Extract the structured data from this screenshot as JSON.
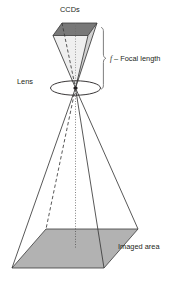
{
  "figure": {
    "labels": {
      "ccds": "CCDs",
      "lens": "Lens",
      "focal_symbol": "f",
      "focal_text": "– Focal length",
      "imaged_area": "Imaged area"
    },
    "colors": {
      "background": "#ffffff",
      "ink": "#231f20",
      "line": "#3a3a3a",
      "ccd_top_fill": "#787878",
      "ccd_side_fill": "#c9c9c9",
      "imaged_area_fill": "#b2b2b2",
      "bracket": "#6f6f6f"
    },
    "geometry": {
      "apex": {
        "x": 75.5,
        "y": 88.0
      },
      "ccd_plane": {
        "front_left": {
          "x": 53.0,
          "y": 35.5
        },
        "front_right": {
          "x": 88.0,
          "y": 35.5
        },
        "back_right": {
          "x": 97.0,
          "y": 23.0
        },
        "back_left": {
          "x": 62.0,
          "y": 23.0
        }
      },
      "imaged_plane": {
        "front_left": {
          "x": 12.0,
          "y": 268.0
        },
        "front_right": {
          "x": 104.0,
          "y": 268.0
        },
        "back_right": {
          "x": 138.0,
          "y": 229.0
        },
        "back_left": {
          "x": 46.0,
          "y": 229.0
        }
      },
      "lens_ellipse": {
        "cx": 75.5,
        "cy": 88.0,
        "rx": 25.0,
        "ry": 7.2
      },
      "optical_axis": {
        "x": 75.5,
        "y_top": 23.0,
        "y_bottom": 248.0
      },
      "focal_bracket": {
        "x": 101.0,
        "y_top": 27.0,
        "y_bottom": 90.0
      }
    }
  }
}
